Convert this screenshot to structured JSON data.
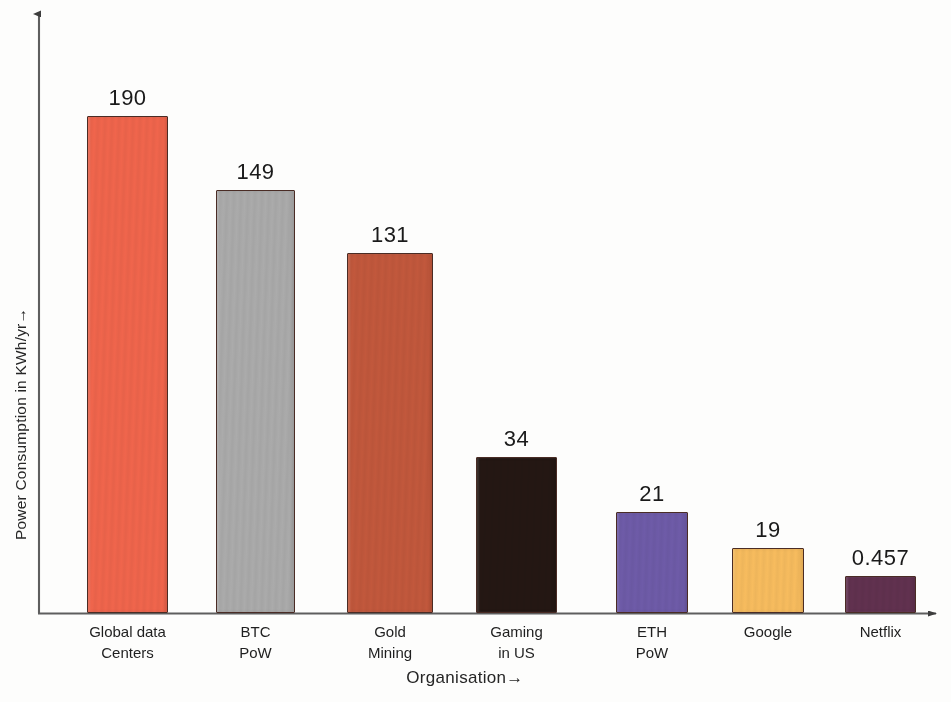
{
  "chart_data": {
    "type": "bar",
    "title": "",
    "xlabel": "Organisation→",
    "ylabel": "Power Consumption in KWh/yr→",
    "categories": [
      "Global data Centers",
      "BTC PoW",
      "Gold Mining",
      "Gaming in US",
      "ETH PoW",
      "Google",
      "Netflix"
    ],
    "category_lines": [
      [
        "Global data",
        "Centers"
      ],
      [
        "BTC",
        "PoW"
      ],
      [
        "Gold",
        "Mining"
      ],
      [
        "Gaming",
        "in US"
      ],
      [
        "ETH",
        "PoW"
      ],
      [
        "Google",
        ""
      ],
      [
        "Netflix",
        ""
      ]
    ],
    "values": [
      190,
      149,
      131,
      34,
      21,
      19,
      0.457
    ],
    "value_labels": [
      "190",
      "149",
      "131",
      "34",
      "21",
      "19",
      "0.457"
    ],
    "colors": [
      "#F0654C",
      "#ABABAB",
      "#C2583C",
      "#241713",
      "#6E5BA8",
      "#F7BC5E",
      "#61314F"
    ],
    "bar_border_color": "#4A2C25",
    "ylim": [
      0,
      200
    ],
    "grid": false,
    "legend": false,
    "axis_arrows": true,
    "axis_color": "#5a5a5a"
  },
  "axes": {
    "y_title": "Power Consumption in KWh/yr→",
    "x_title": "Organisation→"
  },
  "bars": [
    {
      "label_line1": "Global data",
      "label_line2": "Centers",
      "value": "190",
      "color": "#F0654C",
      "x": 87,
      "width": 81,
      "top": 116
    },
    {
      "label_line1": "BTC",
      "label_line2": "PoW",
      "value": "149",
      "color": "#ABABAB",
      "x": 216,
      "width": 79,
      "top": 190
    },
    {
      "label_line1": "Gold",
      "label_line2": "Mining",
      "value": "131",
      "color": "#C2583C",
      "x": 347,
      "width": 86,
      "top": 253
    },
    {
      "label_line1": "Gaming",
      "label_line2": "in US",
      "value": "34",
      "color": "#241713",
      "x": 476,
      "width": 81,
      "top": 457
    },
    {
      "label_line1": "ETH",
      "label_line2": "PoW",
      "value": "21",
      "color": "#6E5BA8",
      "x": 616,
      "width": 72,
      "top": 512
    },
    {
      "label_line1": "Google",
      "label_line2": "",
      "value": "19",
      "color": "#F7BC5E",
      "x": 732,
      "width": 72,
      "top": 548
    },
    {
      "label_line1": "Netflix",
      "label_line2": "",
      "value": "0.457",
      "color": "#61314F",
      "x": 845,
      "width": 71,
      "top": 576
    }
  ]
}
